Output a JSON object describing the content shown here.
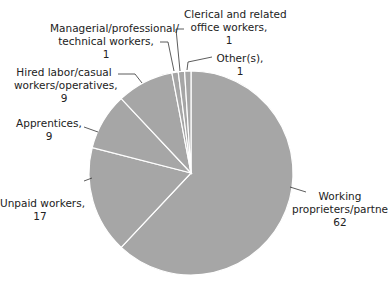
{
  "chart_data": {
    "type": "pie",
    "title": "",
    "start_angle_deg": 0,
    "direction": "clockwise",
    "slice_color": "#a6a6a6",
    "separator_color": "#ffffff",
    "categories": [
      "Working proprieters/partners",
      "Unpaid workers",
      "Apprentices",
      "Hired labor/casual workers/operatives",
      "Managerial/professional/technical workers",
      "Clerical and related office workers",
      "Other(s)"
    ],
    "values": [
      62,
      17,
      9,
      9,
      1,
      1,
      1
    ],
    "legend": "none (direct labels with leader lines)"
  },
  "labels": {
    "working": [
      "Working",
      "proprieters/partners,",
      "62"
    ],
    "unpaid": [
      "Unpaid workers,",
      "17"
    ],
    "apprentices": [
      "Apprentices,",
      "9"
    ],
    "hired": [
      "Hired labor/casual",
      "workers/operatives,",
      "9"
    ],
    "managerial": [
      "Managerial/professional/",
      "technical workers,",
      "1"
    ],
    "clerical": [
      "Clerical and related",
      "office workers,",
      "1"
    ],
    "other": [
      "Other(s),",
      "1"
    ]
  }
}
